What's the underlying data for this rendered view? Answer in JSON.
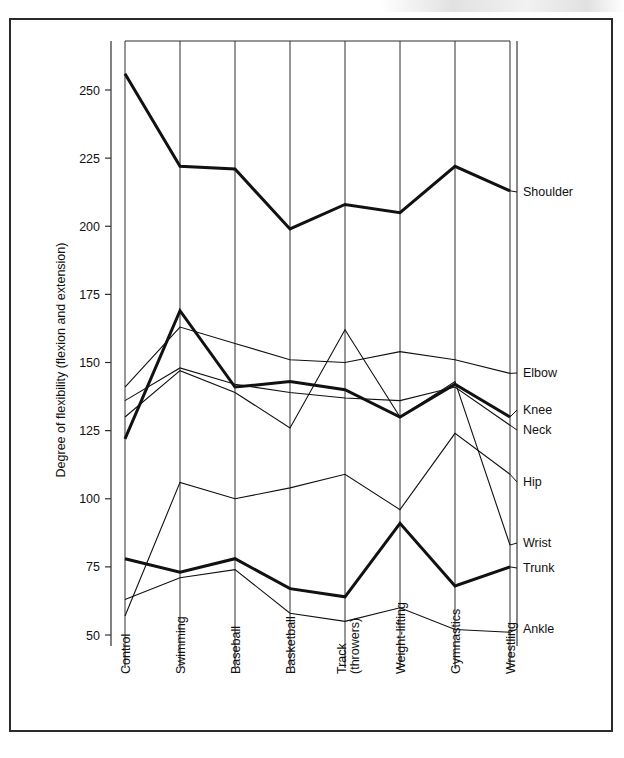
{
  "figure": {
    "border_color": "#2b2b2b",
    "background": "#ffffff",
    "line_color": "#111111"
  },
  "axis": {
    "y_title": "Degree of flexibility (flexion and extension)",
    "y_ticks": [
      "250",
      "225",
      "200",
      "175",
      "150",
      "125",
      "100",
      "75",
      "50"
    ],
    "x_labels": [
      "Control",
      "Swimming",
      "Baseball",
      "Basketball",
      "Track\n(throwers)",
      "Weight-lifting",
      "Gymnastics",
      "Wrestling"
    ],
    "x_labels_line1": [
      "Control",
      "Swimming",
      "Baseball",
      "Basketball",
      "Track",
      "Weight-lifting",
      "Gymnastics",
      "Wrestling"
    ],
    "x_labels_line2": [
      "",
      "",
      "",
      "",
      "(throwers)",
      "",
      "",
      ""
    ]
  },
  "series_labels": [
    "Shoulder",
    "Elbow",
    "Knee",
    "Neck",
    "Hip",
    "Wrist",
    "Trunk",
    "Ankle"
  ],
  "chart_data": {
    "type": "line",
    "title": "",
    "subtitle": "",
    "xlabel": "",
    "ylabel": "Degree of flexibility (flexion and extension)",
    "ylim": [
      40,
      268
    ],
    "y_ticks": [
      250,
      225,
      200,
      175,
      150,
      125,
      100,
      75,
      50
    ],
    "grid": "vertical-only",
    "legend": "right-end-labels",
    "categories": [
      "Control",
      "Swimming",
      "Baseball",
      "Basketball",
      "Track (throwers)",
      "Weight-lifting",
      "Gymnastics",
      "Wrestling"
    ],
    "series": [
      {
        "name": "Shoulder",
        "weight": "thick",
        "values": [
          256,
          222,
          221,
          199,
          208,
          205,
          222,
          213
        ]
      },
      {
        "name": "Elbow",
        "weight": "thin",
        "values": [
          141,
          163,
          157,
          151,
          150,
          154,
          151,
          146
        ]
      },
      {
        "name": "Knee",
        "weight": "thick",
        "values": [
          122,
          169,
          141,
          143,
          140,
          130,
          142,
          130
        ]
      },
      {
        "name": "Neck",
        "weight": "thin",
        "values": [
          136,
          148,
          142,
          139,
          137,
          136,
          141,
          127
        ]
      },
      {
        "name": "Hip",
        "weight": "thin",
        "values": [
          57,
          106,
          100,
          104,
          109,
          96,
          124,
          109
        ]
      },
      {
        "name": "Wrist",
        "weight": "thin",
        "values": [
          130,
          147,
          139,
          126,
          162,
          130,
          143,
          83
        ]
      },
      {
        "name": "Trunk",
        "weight": "thick",
        "values": [
          78,
          73,
          78,
          67,
          64,
          91,
          68,
          75
        ]
      },
      {
        "name": "Ankle",
        "weight": "thin",
        "values": [
          63,
          71,
          74,
          58,
          55,
          60,
          52,
          51
        ]
      }
    ]
  }
}
